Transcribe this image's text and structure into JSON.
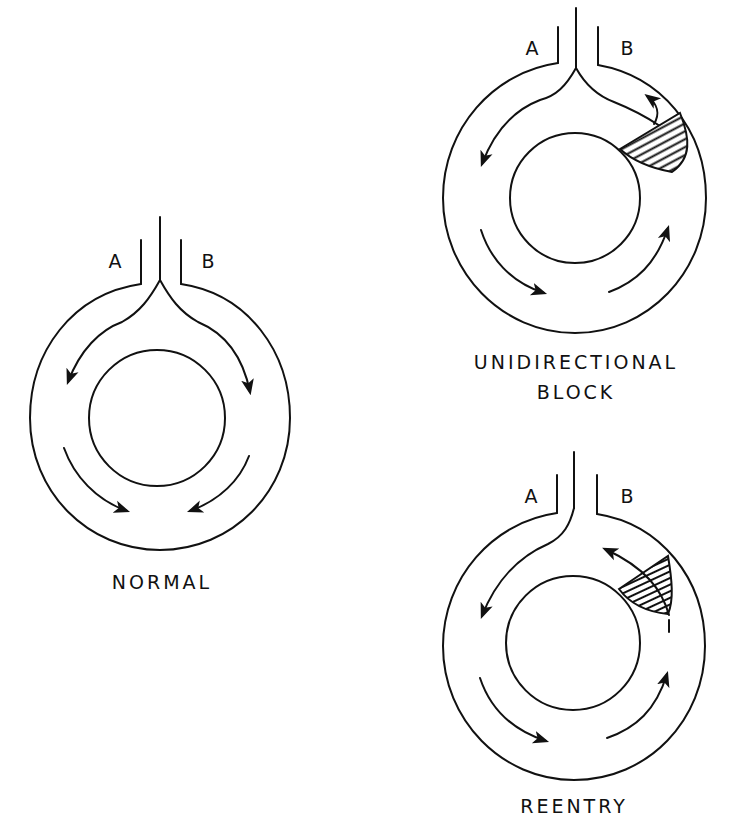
{
  "figure": {
    "ink_color": "#111111",
    "background_color": "#ffffff",
    "panels": [
      {
        "id": "normal",
        "caption_lines": [
          "NORMAL"
        ],
        "branch_labels": {
          "left": "A",
          "right": "B"
        },
        "hatched_block": false
      },
      {
        "id": "unidirectional-block",
        "caption_lines": [
          "UNIDIRECTIONAL",
          "BLOCK"
        ],
        "branch_labels": {
          "left": "A",
          "right": "B"
        },
        "hatched_block": true
      },
      {
        "id": "reentry",
        "caption_lines": [
          "REENTRY"
        ],
        "branch_labels": {
          "left": "A",
          "right": "B"
        },
        "hatched_block": true
      }
    ]
  }
}
